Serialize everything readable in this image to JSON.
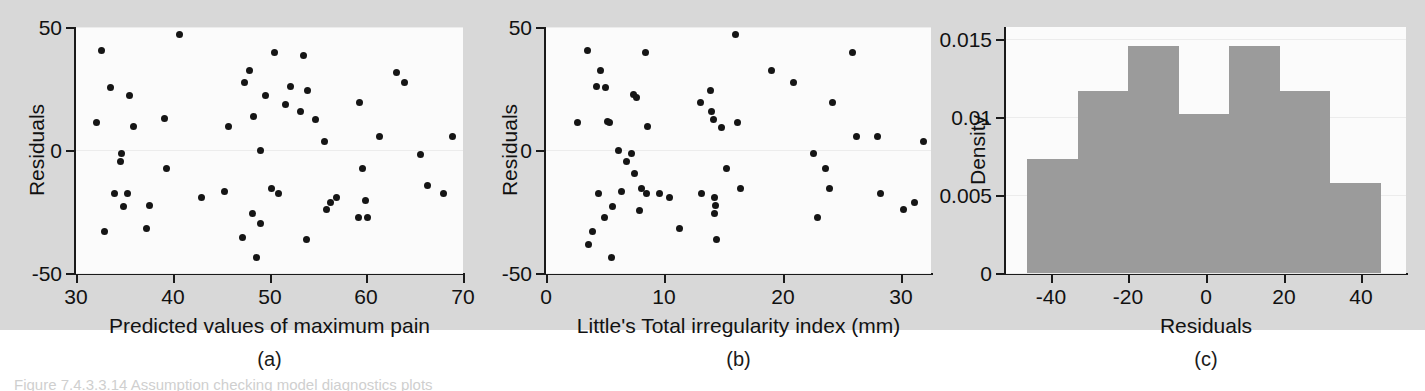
{
  "figure": {
    "background_color": "#ffffff",
    "panel_background_color": "#d8d8d8",
    "plot_background_color": "#fbfbfb",
    "marker_color": "#151515",
    "bar_color": "#9b9b9b",
    "axis_color": "#1a1a1a",
    "caption_truncated": "Figure 7.4.3.3.14 Assumption checking model diagnostics plots"
  },
  "panel_labels": {
    "a": "(a)",
    "b": "(b)",
    "c": "(c)"
  },
  "chart_data": [
    {
      "id": "panel-a",
      "type": "scatter",
      "title": "",
      "xlabel": "Predicted values of maximum pain",
      "ylabel": "Residuals",
      "xlim": [
        30,
        70
      ],
      "ylim": [
        -50,
        50
      ],
      "xticks": [
        30,
        40,
        50,
        60,
        70
      ],
      "yticks": [
        -50,
        0,
        50
      ],
      "xticklabels": [
        "30",
        "40",
        "50",
        "60",
        "70"
      ],
      "yticklabels": [
        "-50",
        "0",
        "50"
      ],
      "grid": true,
      "legend": null,
      "points": [
        [
          32.6,
          40.5
        ],
        [
          32.1,
          11.0
        ],
        [
          32.9,
          -33.0
        ],
        [
          33.6,
          25.5
        ],
        [
          34.0,
          -17.5
        ],
        [
          34.7,
          -1.5
        ],
        [
          34.6,
          -4.5
        ],
        [
          34.9,
          -23.0
        ],
        [
          35.5,
          22.0
        ],
        [
          35.3,
          -17.5
        ],
        [
          35.9,
          9.5
        ],
        [
          37.3,
          -32.0
        ],
        [
          37.6,
          -22.5
        ],
        [
          39.1,
          13.0
        ],
        [
          39.4,
          -7.5
        ],
        [
          40.7,
          47.0
        ],
        [
          43.0,
          -19.5
        ],
        [
          45.3,
          -17.0
        ],
        [
          45.8,
          9.5
        ],
        [
          47.2,
          -35.5
        ],
        [
          47.4,
          27.5
        ],
        [
          47.9,
          32.5
        ],
        [
          48.3,
          13.5
        ],
        [
          48.2,
          -26.0
        ],
        [
          48.7,
          -43.5
        ],
        [
          49.1,
          -30.0
        ],
        [
          49.6,
          22.0
        ],
        [
          49.1,
          0.0
        ],
        [
          50.5,
          39.5
        ],
        [
          50.2,
          -15.5
        ],
        [
          50.9,
          -17.5
        ],
        [
          51.7,
          18.5
        ],
        [
          52.2,
          26.0
        ],
        [
          53.5,
          38.5
        ],
        [
          53.2,
          15.5
        ],
        [
          53.9,
          24.0
        ],
        [
          53.8,
          -36.5
        ],
        [
          54.8,
          12.5
        ],
        [
          55.7,
          3.5
        ],
        [
          55.9,
          -24.0
        ],
        [
          56.3,
          -21.5
        ],
        [
          56.9,
          -19.5
        ],
        [
          59.3,
          19.5
        ],
        [
          59.6,
          -7.5
        ],
        [
          59.2,
          -27.5
        ],
        [
          59.9,
          -20.5
        ],
        [
          60.1,
          -27.5
        ],
        [
          61.4,
          5.5
        ],
        [
          63.1,
          31.5
        ],
        [
          64.0,
          27.5
        ],
        [
          65.6,
          -2.0
        ],
        [
          66.3,
          -14.5
        ],
        [
          68.0,
          -17.5
        ],
        [
          68.9,
          5.5
        ]
      ]
    },
    {
      "id": "panel-b",
      "type": "scatter",
      "title": "",
      "xlabel": "Little's Total irregularity index (mm)",
      "ylabel": "Residuals",
      "xlim": [
        0,
        32.5
      ],
      "ylim": [
        -50,
        50
      ],
      "xticks": [
        0,
        10,
        20,
        30
      ],
      "yticks": [
        -50,
        0,
        50
      ],
      "xticklabels": [
        "0",
        "10",
        "20",
        "30"
      ],
      "yticklabels": [
        "-50",
        "0",
        "50"
      ],
      "grid": true,
      "legend": null,
      "points": [
        [
          2.7,
          11.0
        ],
        [
          3.5,
          40.5
        ],
        [
          3.6,
          -38.5
        ],
        [
          3.9,
          -33.0
        ],
        [
          4.3,
          26.0
        ],
        [
          4.4,
          -17.5
        ],
        [
          4.6,
          32.5
        ],
        [
          4.9,
          -27.5
        ],
        [
          5.0,
          25.5
        ],
        [
          5.2,
          11.5
        ],
        [
          5.4,
          11.0
        ],
        [
          5.6,
          -23.0
        ],
        [
          5.5,
          -43.5
        ],
        [
          6.1,
          0.0
        ],
        [
          6.4,
          -17.0
        ],
        [
          6.8,
          -4.5
        ],
        [
          7.2,
          -1.5
        ],
        [
          7.4,
          22.5
        ],
        [
          7.6,
          21.5
        ],
        [
          7.5,
          -9.5
        ],
        [
          7.9,
          -24.5
        ],
        [
          8.1,
          -15.5
        ],
        [
          8.4,
          39.5
        ],
        [
          8.6,
          9.5
        ],
        [
          8.5,
          -17.5
        ],
        [
          9.6,
          -17.5
        ],
        [
          10.4,
          -19.5
        ],
        [
          11.3,
          -32.0
        ],
        [
          13.0,
          19.5
        ],
        [
          13.1,
          -17.5
        ],
        [
          13.9,
          24.0
        ],
        [
          14.0,
          15.5
        ],
        [
          14.1,
          12.5
        ],
        [
          14.2,
          -19.5
        ],
        [
          14.3,
          -22.5
        ],
        [
          14.2,
          -26.0
        ],
        [
          14.4,
          -36.5
        ],
        [
          14.8,
          9.0
        ],
        [
          15.2,
          -7.5
        ],
        [
          16.0,
          47.0
        ],
        [
          16.2,
          11.0
        ],
        [
          16.4,
          -15.5
        ],
        [
          19.0,
          32.5
        ],
        [
          20.9,
          27.5
        ],
        [
          22.6,
          -1.5
        ],
        [
          22.9,
          -27.5
        ],
        [
          23.6,
          -7.5
        ],
        [
          23.9,
          -15.5
        ],
        [
          24.2,
          19.5
        ],
        [
          25.9,
          39.5
        ],
        [
          26.2,
          5.5
        ],
        [
          28.0,
          5.5
        ],
        [
          28.2,
          -17.5
        ],
        [
          30.2,
          -24.0
        ],
        [
          31.1,
          -21.5
        ],
        [
          31.9,
          3.5
        ]
      ]
    },
    {
      "id": "panel-c",
      "type": "bar",
      "subtype": "histogram",
      "title": "",
      "xlabel": "Residuals",
      "ylabel": "Density",
      "xlim": [
        -51.5,
        51.5
      ],
      "ylim": [
        0,
        0.0158
      ],
      "xticks": [
        -40,
        -20,
        0,
        20,
        40
      ],
      "yticks": [
        0,
        0.005,
        0.01,
        0.015
      ],
      "xticklabels": [
        "-40",
        "-20",
        "0",
        "20",
        "40"
      ],
      "yticklabels": [
        "0",
        "0.005",
        "0.01",
        "0.015"
      ],
      "grid": true,
      "legend": null,
      "bin_edges": [
        -46,
        -33,
        -20,
        -7,
        6,
        19,
        32,
        45
      ],
      "categories": [
        "-46 to -33",
        "-33 to -20",
        "-20 to -7",
        "-7 to 6",
        "6 to 19",
        "19 to 32",
        "32 to 45"
      ],
      "values": [
        0.0073,
        0.0117,
        0.0146,
        0.0102,
        0.0146,
        0.0117,
        0.0058
      ]
    }
  ]
}
